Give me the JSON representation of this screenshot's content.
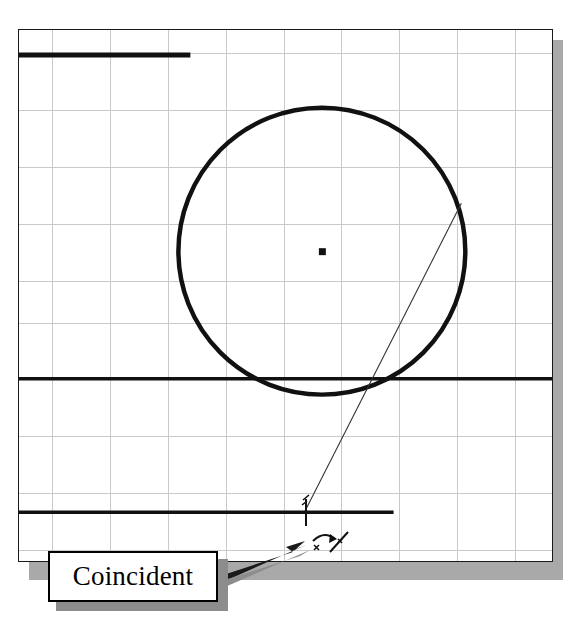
{
  "app": {
    "kind": "cad-sketch-viewport",
    "caption": "SolidWorks sketch viewport showing a circle, construction line and coincident relation cursor"
  },
  "viewport": {
    "name": "sketch-viewport",
    "background_color": "#ffffff",
    "frame_color": "#1a1a1a",
    "shadow_color": "#a9a9a9",
    "grid": {
      "visible": true,
      "color": "#c8c8c8",
      "spacing_x": 58,
      "spacing_y": 57,
      "origin_x": 19,
      "origin_y": 30
    }
  },
  "geometry": {
    "line_color": "#000000",
    "circle": {
      "label": "sketch-circle",
      "center_x": 323,
      "center_y": 252,
      "radius": 144,
      "stroke_width": 4
    },
    "center_point": {
      "label": "circle-center-point",
      "x": 323,
      "y": 252,
      "size": 6
    },
    "horizontal_lines": [
      {
        "label": "top-edge-line",
        "x1": 19,
        "y1": 54,
        "x2": 190,
        "y2": 54,
        "width": 4
      },
      {
        "label": "middle-edge-line",
        "x1": 19,
        "y1": 380,
        "x2": 553,
        "y2": 380,
        "width": 3
      },
      {
        "label": "bottom-edge-line",
        "x1": 19,
        "y1": 514,
        "x2": 394,
        "y2": 514,
        "width": 3
      }
    ],
    "construction_line": {
      "label": "angled-construction-line",
      "x1": 463,
      "y1": 204,
      "x2": 306,
      "y2": 512,
      "width": 1
    }
  },
  "cursor": {
    "label": "crosshair-cursor",
    "x": 306,
    "y": 512,
    "arm": 13,
    "relation_glyph": {
      "label": "coincident-relation-glyph",
      "x": 312,
      "y": 528,
      "width": 42,
      "height": 32
    }
  },
  "callout": {
    "label_text": "Coincident",
    "box": {
      "x": 48,
      "y": 551,
      "width": 170,
      "height": 51
    },
    "shadow_offset": 8,
    "border_color": "#000000",
    "fill_color": "#ffffff",
    "arrow": {
      "label": "callout-arrow",
      "from_x": 218,
      "from_y": 578,
      "to_x": 312,
      "to_y": 543
    }
  }
}
